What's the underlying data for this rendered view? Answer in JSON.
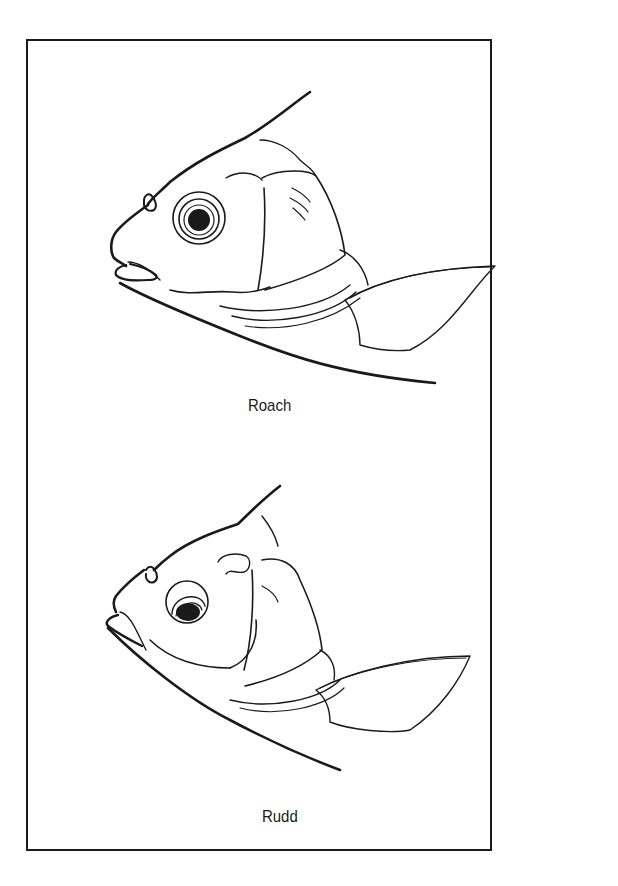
{
  "figure": {
    "panels": [
      {
        "label": "Roach"
      },
      {
        "label": "Rudd"
      }
    ]
  },
  "colors": {
    "ink": "#1a1a1a",
    "paper": "#ffffff"
  }
}
